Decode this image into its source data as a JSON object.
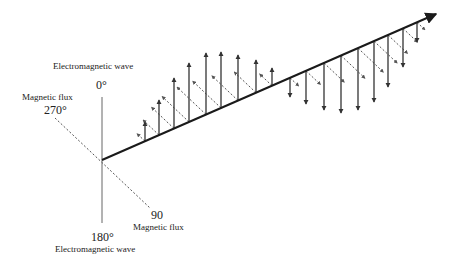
{
  "labels": {
    "em_wave_top": "Electromagnetic wave",
    "em_wave_bottom": "Electromagnetic wave",
    "deg_0": "0°",
    "deg_180": "180°",
    "deg_270": "270°",
    "deg_90": "90",
    "mag_flux_left": "Magnetic flux",
    "mag_flux_right": "Magnetic flux"
  },
  "colors": {
    "axis": "#1a1a1a",
    "em_arrow": "#333333",
    "mag_arrow": "#555555",
    "text": "#222222"
  },
  "geometry": {
    "origin": [
      102,
      160
    ],
    "axis_end": [
      436,
      14
    ],
    "vertical_axis": [
      97,
      223
    ],
    "mag_axis_270_start": [
      55,
      118
    ],
    "mag_axis_90_end": [
      150,
      208
    ]
  },
  "em_arrows": [
    {
      "x": 145,
      "tip": 122
    },
    {
      "x": 159,
      "tip": 100
    },
    {
      "x": 174,
      "tip": 78
    },
    {
      "x": 189,
      "tip": 63
    },
    {
      "x": 206,
      "tip": 53
    },
    {
      "x": 221,
      "tip": 52
    },
    {
      "x": 238,
      "tip": 55
    },
    {
      "x": 256,
      "tip": 60
    },
    {
      "x": 272,
      "tip": 68
    },
    {
      "x": 290,
      "tip": 97
    },
    {
      "x": 306,
      "tip": 104
    },
    {
      "x": 324,
      "tip": 110
    },
    {
      "x": 341,
      "tip": 113
    },
    {
      "x": 358,
      "tip": 110
    },
    {
      "x": 374,
      "tip": 102
    },
    {
      "x": 388,
      "tip": 87
    },
    {
      "x": 403,
      "tip": 67
    },
    {
      "x": 417,
      "tip": 42
    }
  ],
  "mag_arrows": [
    {
      "x": 145,
      "len": 11
    },
    {
      "x": 159,
      "len": 22
    },
    {
      "x": 174,
      "len": 31
    },
    {
      "x": 189,
      "len": 37
    },
    {
      "x": 206,
      "len": 40
    },
    {
      "x": 221,
      "len": 39
    },
    {
      "x": 238,
      "len": 36
    },
    {
      "x": 256,
      "len": 30
    },
    {
      "x": 272,
      "len": 17
    },
    {
      "x": 290,
      "len": -12
    },
    {
      "x": 306,
      "len": -20
    },
    {
      "x": 324,
      "len": -28
    },
    {
      "x": 341,
      "len": -33
    },
    {
      "x": 358,
      "len": -35
    },
    {
      "x": 374,
      "len": -32
    },
    {
      "x": 388,
      "len": -27
    },
    {
      "x": 403,
      "len": -20
    },
    {
      "x": 417,
      "len": -11
    }
  ]
}
